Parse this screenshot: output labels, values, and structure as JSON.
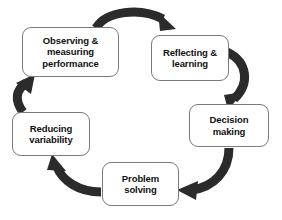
{
  "diagram": {
    "type": "cycle",
    "direction": "clockwise",
    "background_color": "#ffffff",
    "arrow_color": "#2b2b2b",
    "node_fill_color": "#ffffff",
    "node_border_color": "#7a7a7a",
    "text_color": "#111111",
    "nodes": [
      {
        "id": "observing",
        "label": "Observing &\nmeasuring\nperformance"
      },
      {
        "id": "reflecting",
        "label": "Reflecting &\nlearning"
      },
      {
        "id": "decision",
        "label": "Decision\nmaking"
      },
      {
        "id": "problem",
        "label": "Problem\nsolving"
      },
      {
        "id": "reducing",
        "label": "Reducing\nvariability"
      }
    ],
    "arrows": [
      {
        "id": "arrow-observing-to-reflecting",
        "from": "observing",
        "to": "reflecting"
      },
      {
        "id": "arrow-reflecting-to-decision",
        "from": "reflecting",
        "to": "decision"
      },
      {
        "id": "arrow-decision-to-problem",
        "from": "decision",
        "to": "problem"
      },
      {
        "id": "arrow-problem-to-reducing",
        "from": "problem",
        "to": "reducing"
      },
      {
        "id": "arrow-reducing-to-observing",
        "from": "reducing",
        "to": "observing"
      }
    ]
  }
}
